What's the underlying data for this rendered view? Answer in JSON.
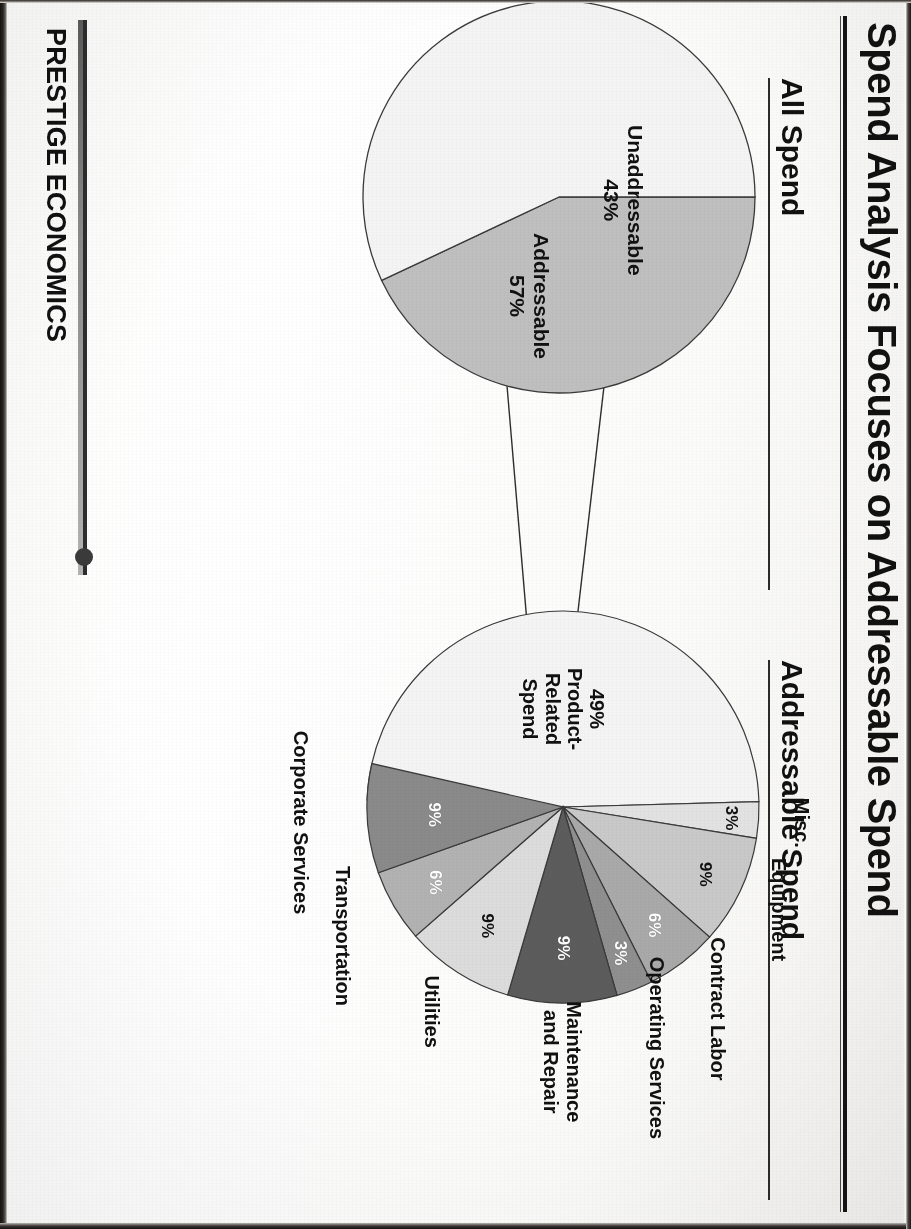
{
  "slide": {
    "title": "Spend Analysis Focuses on Addressable Spend",
    "brand": "PRESTIGE ECONOMICS"
  },
  "sections": [
    {
      "key": "all_spend",
      "label": "All Spend"
    },
    {
      "key": "addressable_spend",
      "label": "Addressable Spend"
    }
  ],
  "colors": {
    "ink": "#111111",
    "rule": "#2b2b2b",
    "slice_light": "#f2f2f2",
    "slice_gray": "#bfbfbf",
    "slice_mid": "#9a9a9a",
    "slice_dark": "#6e6e6e",
    "slice_darkest": "#585858"
  },
  "chart_data": [
    {
      "type": "pie",
      "title": "All Spend",
      "labels": [
        "Unaddressable",
        "Addressable"
      ],
      "values": [
        43,
        57
      ],
      "value_labels": [
        "43%",
        "57%"
      ],
      "unit": "%",
      "legend": "none",
      "slice_colors": [
        "#bfbfbf",
        "#f4f4f4"
      ]
    },
    {
      "type": "pie",
      "title": "Addressable Spend",
      "labels": [
        "Product-Related Spend",
        "Misc.",
        "Equipment",
        "Contract Labor",
        "Operating Services",
        "Maintenance and Repair",
        "Utilities",
        "Transportation",
        "Corporate Services"
      ],
      "values": [
        49,
        3,
        9,
        6,
        3,
        9,
        9,
        6,
        9
      ],
      "value_labels": [
        "49%",
        "3%",
        "9%",
        "6%",
        "3%",
        "9%",
        "9%",
        "6%",
        "9%"
      ],
      "unit": "%",
      "legend": "none",
      "slice_colors": [
        "#f4f4f4",
        "#e2e2e2",
        "#c9c9c9",
        "#a9a9a9",
        "#8f8f8f",
        "#5c5c5c",
        "#dcdcdc",
        "#b2b2b2",
        "#8a8a8a"
      ]
    }
  ],
  "pie1": {
    "unaddressable_label": "Unaddressable",
    "unaddressable_value": "43%",
    "addressable_label": "Addressable",
    "addressable_value": "57%"
  },
  "pie2": {
    "product_label": "Product-\nRelated\nSpend",
    "product_line1": "Product-",
    "product_line2": "Related",
    "product_line3": "Spend",
    "product_value": "49%",
    "misc_label": "Misc.",
    "misc_value": "3%",
    "equipment_label": "Equipment",
    "equipment_value": "9%",
    "contract_label": "Contract Labor",
    "contract_value": "6%",
    "operating_label": "Operating Services",
    "operating_value": "3%",
    "maint_line1": "Maintenance",
    "maint_line2": "and Repair",
    "maint_value": "9%",
    "utilities_label": "Utilities",
    "utilities_value": "9%",
    "transport_label": "Transportation",
    "transport_value": "6%",
    "corporate_label": "Corporate Services",
    "corporate_value": "9%"
  }
}
